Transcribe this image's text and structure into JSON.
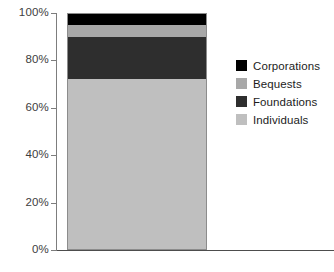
{
  "chart_data": {
    "type": "bar",
    "title": "",
    "subtitle": "",
    "xlabel": "",
    "ylabel": "",
    "stacked": true,
    "orientation": "vertical",
    "grid": false,
    "legend_position": "right",
    "categories": [
      ""
    ],
    "ylim": [
      0,
      100
    ],
    "yticks": [
      0,
      20,
      40,
      60,
      80,
      100
    ],
    "ytick_labels": [
      "0%",
      "20%",
      "40%",
      "60%",
      "80%",
      "100%"
    ],
    "series": [
      {
        "name": "Individuals",
        "values": [
          72
        ],
        "color": "#bfbfbf"
      },
      {
        "name": "Foundations",
        "values": [
          18
        ],
        "color": "#2e2e2e"
      },
      {
        "name": "Bequests",
        "values": [
          5
        ],
        "color": "#a8a8a8"
      },
      {
        "name": "Corporations",
        "values": [
          5
        ],
        "color": "#000000"
      }
    ]
  },
  "axis": {
    "ticks": [
      {
        "label": "100%",
        "value": 100
      },
      {
        "label": "80%",
        "value": 80
      },
      {
        "label": "60%",
        "value": 60
      },
      {
        "label": "40%",
        "value": 40
      },
      {
        "label": "20%",
        "value": 20
      },
      {
        "label": "0%",
        "value": 0
      }
    ]
  },
  "legend": {
    "items": [
      {
        "label": "Corporations",
        "color": "#000000"
      },
      {
        "label": "Bequests",
        "color": "#a8a8a8"
      },
      {
        "label": "Foundations",
        "color": "#2e2e2e"
      },
      {
        "label": "Individuals",
        "color": "#bfbfbf"
      }
    ]
  },
  "caption": {
    "cropped_text": ""
  },
  "colors": {
    "axis": "#7d7d7d",
    "axis_x": "#4d4d4d",
    "text": "#1c1c1c",
    "tick_text": "#3d3d3d",
    "background": "#ffffff",
    "bar_outline": "#8c8c8c"
  }
}
